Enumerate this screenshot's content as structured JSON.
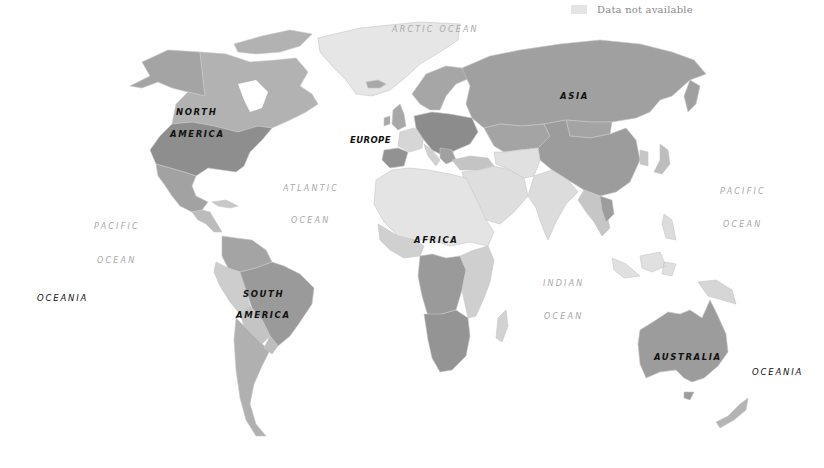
{
  "legend": {
    "items": [
      {
        "label": "Data not available",
        "color": "#e4e4e4"
      }
    ]
  },
  "colors": {
    "background": "#ffffff",
    "no_data": "#e4e4e4",
    "shade_light": "#d2d2d2",
    "shade_mid": "#b4b4b4",
    "shade_dark": "#9a9a9a",
    "shade_darkest": "#8a8a8a",
    "border": "#c9c9c9"
  },
  "continent_labels": {
    "north_america_1": "NORTH",
    "north_america_2": "AMERICA",
    "south_america_1": "SOUTH",
    "south_america_2": "AMERICA",
    "europe": "EUROPE",
    "asia": "ASIA",
    "africa": "AFRICA",
    "australia": "AUSTRALIA",
    "oceania_west": "OCEANIA",
    "oceania_east": "OCEANIA"
  },
  "ocean_labels": {
    "arctic": "ARCTIC OCEAN",
    "atlantic_1": "ATLANTIC",
    "atlantic_2": "OCEAN",
    "pacific_west_1": "PACIFIC",
    "pacific_west_2": "OCEAN",
    "pacific_east_1": "PACIFIC",
    "pacific_east_2": "OCEAN",
    "indian_1": "INDIAN",
    "indian_2": "OCEAN"
  }
}
